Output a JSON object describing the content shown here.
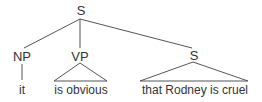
{
  "tree": {
    "root": {
      "label": "S",
      "children": [
        {
          "label": "NP",
          "leaf": "it",
          "leaf_style": "line"
        },
        {
          "label": "VP",
          "leaf": "is obvious",
          "leaf_style": "triangle"
        },
        {
          "label": "S",
          "leaf": "that Rodney is cruel",
          "leaf_style": "triangle"
        }
      ]
    }
  }
}
